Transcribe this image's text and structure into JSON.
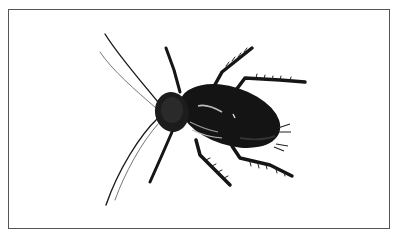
{
  "image": {
    "subject": "cockroach illustration",
    "alt": "Black-and-white illustration of a dark cockroach viewed from above, with long antennae pointing to the left and six spiny legs",
    "colors": {
      "frame_border": "#555555",
      "background": "#ffffff",
      "body": "#141414",
      "highlight": "#bdbdbd"
    }
  }
}
